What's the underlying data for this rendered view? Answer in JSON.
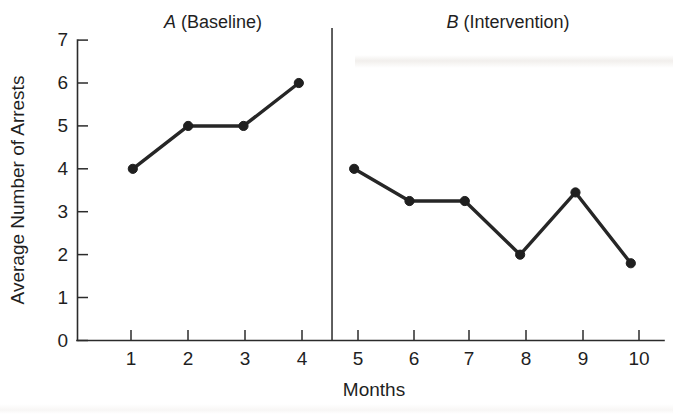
{
  "chart_data": {
    "type": "line",
    "title": "",
    "xlabel": "Months",
    "ylabel": "Average Number of Arrests",
    "xlim": [
      0,
      10.6
    ],
    "ylim": [
      0,
      7
    ],
    "grid": false,
    "legend_position": "none",
    "x_tick_labels": [
      "1",
      "2",
      "3",
      "4",
      "5",
      "6",
      "7",
      "8",
      "9",
      "10"
    ],
    "x_ticks": [
      1,
      2,
      3,
      4,
      5,
      6,
      7,
      8,
      9,
      10
    ],
    "y_tick_labels": [
      "0",
      "1",
      "2",
      "3",
      "4",
      "5",
      "6",
      "7"
    ],
    "y_ticks": [
      0,
      1,
      2,
      3,
      4,
      5,
      6,
      7
    ],
    "phase_divider_x": 4.6,
    "series": [
      {
        "name": "A (Baseline)",
        "x": [
          1,
          2,
          3,
          4
        ],
        "values": [
          4.0,
          5.0,
          5.0,
          6.0
        ]
      },
      {
        "name": "B (Intervention)",
        "x": [
          5,
          6,
          7,
          8,
          9,
          10
        ],
        "values": [
          4.0,
          3.25,
          3.25,
          2.0,
          3.45,
          1.8
        ]
      }
    ],
    "annotations": [
      {
        "id": "phase-a",
        "letter": "A",
        "text": " (Baseline)",
        "x": 2.5
      },
      {
        "id": "phase-b",
        "letter": "B",
        "text": " (Intervention)",
        "x": 7.5
      }
    ]
  },
  "labels": {
    "y_axis_title": "Average Number of Arrests",
    "x_axis_title": "Months",
    "phase_a_letter": "A",
    "phase_a_rest": " (Baseline)",
    "phase_b_letter": "B",
    "phase_b_rest": " (Intervention)",
    "y0": "0",
    "y1": "1",
    "y2": "2",
    "y3": "3",
    "y4": "4",
    "y5": "5",
    "y6": "6",
    "y7": "7",
    "x1": "1",
    "x2": "2",
    "x3": "3",
    "x4": "4",
    "x5": "5",
    "x6": "6",
    "x7": "7",
    "x8": "8",
    "x9": "9",
    "x10": "10"
  },
  "colors": {
    "background": "#ffffff",
    "ink": "#1f1f1f",
    "axis": "#2b2b2b",
    "series": "#262626"
  }
}
